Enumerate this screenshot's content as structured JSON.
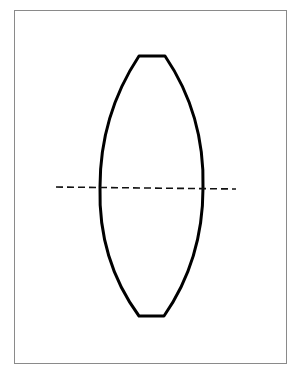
{
  "diagram": {
    "type": "biconvex-lens",
    "colors": {
      "background": "#ffffff",
      "frame": "#8a8a8a",
      "lens_stroke": "#000000",
      "axis_stroke": "#111111"
    },
    "frame": {
      "x": 14,
      "y": 10,
      "width": 272,
      "height": 353
    },
    "lens": {
      "top_flat": {
        "x1": 139,
        "x2": 165,
        "y": 56
      },
      "bottom_flat": {
        "x1": 139,
        "x2": 164,
        "y": 316
      },
      "left_edge_at_axis_x": 100,
      "right_edge_at_axis_x": 202,
      "stroke_width": 3
    },
    "optical_axis": {
      "x1": 56,
      "y1": 187,
      "x2": 236,
      "y2": 189,
      "dash": "7 4",
      "stroke_width": 1.6
    }
  }
}
